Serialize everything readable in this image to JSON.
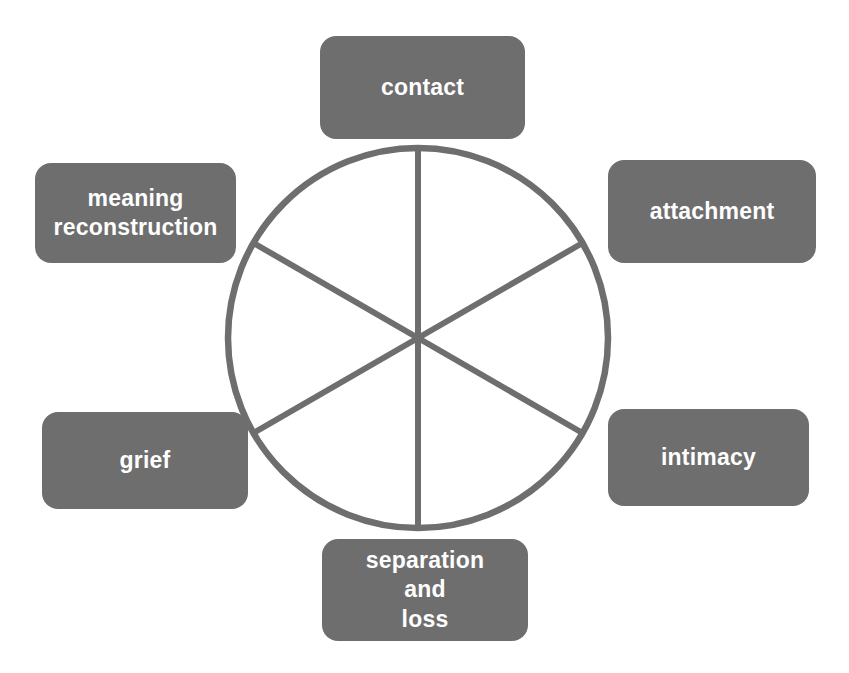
{
  "diagram": {
    "shape": "circle divided into six equal sectors by three diameters",
    "colors": {
      "box_fill": "#6e6e6e",
      "box_text": "#ffffff",
      "stroke": "#6e6e6e",
      "background": "#ffffff"
    },
    "circle": {
      "center_x": 418,
      "center_y": 338,
      "radius": 190,
      "stroke_width": 6,
      "sector_count": 6,
      "spoke_angles_deg": [
        90,
        270,
        30,
        210,
        150,
        330
      ]
    },
    "nodes": [
      {
        "id": "contact",
        "label": "contact",
        "position": "top"
      },
      {
        "id": "attachment",
        "label": "attachment",
        "position": "upper-right"
      },
      {
        "id": "intimacy",
        "label": "intimacy",
        "position": "lower-right"
      },
      {
        "id": "separation",
        "label": "separation\nand\nloss",
        "position": "bottom"
      },
      {
        "id": "grief",
        "label": "grief",
        "position": "lower-left"
      },
      {
        "id": "meaning",
        "label": "meaning\nreconstruction",
        "position": "upper-left"
      }
    ]
  }
}
